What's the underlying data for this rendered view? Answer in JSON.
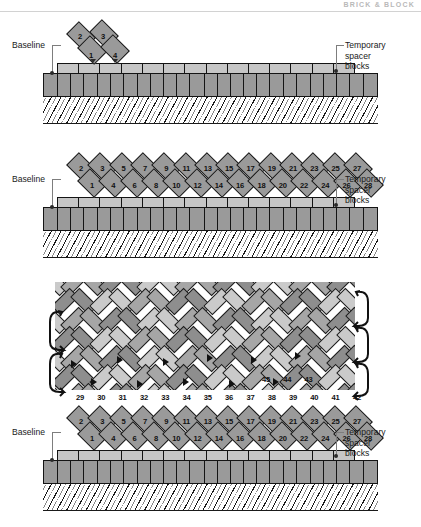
{
  "figure": {
    "running_head": "BRICK & BLOCK",
    "type": "masonry-herringbone-paving-construction-sequence",
    "panel_count": 3
  },
  "labels": {
    "baseline": "Baseline",
    "spacer_blocks": "Temporary\nspacer\nblocks"
  },
  "panels": [
    {
      "id": "panel-1",
      "caption_left": "Baseline",
      "caption_right": "Temporary\nspacer\nblocks",
      "brick_numbers_top": [
        "2",
        "3"
      ],
      "brick_numbers_bottom": [
        "1",
        "4"
      ],
      "wall_block_count": 25,
      "spacer_block_count": 14
    },
    {
      "id": "panel-2",
      "caption_left": "Baseline",
      "caption_right": "Temporary\nspacer\nblocks",
      "brick_numbers_top": [
        "2",
        "3",
        "5",
        "7",
        "9",
        "11",
        "13",
        "15",
        "17",
        "19",
        "21",
        "23",
        "25",
        "27"
      ],
      "brick_numbers_bottom": [
        "1",
        "4",
        "6",
        "8",
        "10",
        "12",
        "14",
        "16",
        "18",
        "20",
        "22",
        "24",
        "26",
        "28"
      ],
      "wall_block_count": 25,
      "spacer_block_count": 14
    },
    {
      "id": "panel-3",
      "caption_left": "Baseline",
      "caption_right": "Temporary\nspacer\nblocks",
      "brick_numbers_top": [
        "2",
        "3",
        "5",
        "7",
        "9",
        "11",
        "13",
        "15",
        "17",
        "19",
        "21",
        "23",
        "25",
        "27"
      ],
      "brick_numbers_bottom": [
        "1",
        "4",
        "6",
        "8",
        "10",
        "12",
        "14",
        "16",
        "18",
        "20",
        "22",
        "24",
        "26",
        "28"
      ],
      "brick_numbers_course3": [
        "29",
        "30",
        "31",
        "32",
        "33",
        "34",
        "35",
        "36",
        "37",
        "38",
        "39",
        "40",
        "41",
        "42"
      ],
      "brick_numbers_course4": [
        "45",
        "44",
        "43"
      ],
      "wall_block_count": 25,
      "spacer_block_count": 14,
      "left_bracket_count": 2,
      "right_bracket_count": 3
    }
  ],
  "colors": {
    "brick_dark": "#9a9a9a",
    "brick_light": "#c9c9c9",
    "brick_darker": "#848484",
    "wall_block": "#9a9a9a",
    "spacer_block": "#c6c6c6",
    "outline": "#161616",
    "leader": "#7d7d7d",
    "ground_hatch": "#1a1a1a",
    "background": "#ffffff"
  }
}
